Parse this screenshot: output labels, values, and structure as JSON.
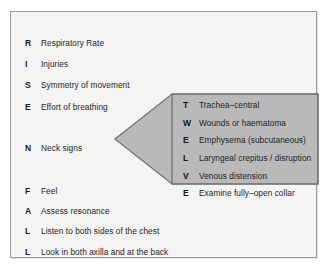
{
  "figure": {
    "panel_background": "#f4f4f2",
    "panel_border": "#9a9a9a",
    "callout_fill": "#b9b9b9",
    "callout_border": "#6f6f6f"
  },
  "main_list": {
    "name": "rise-n-fall-mnemonic",
    "items": [
      {
        "letter": "R",
        "text": "Respiratory Rate",
        "top": 24
      },
      {
        "letter": "I",
        "text": "Injuries",
        "top": 45
      },
      {
        "letter": "S",
        "text": "Symmetry of movement",
        "top": 66
      },
      {
        "letter": "E",
        "text": "Effort of breathing",
        "top": 88
      },
      {
        "letter": "N",
        "text": "Neck signs",
        "top": 129
      },
      {
        "letter": "F",
        "text": "Feel",
        "top": 172
      },
      {
        "letter": "A",
        "text": "Assess resonance",
        "top": 192
      },
      {
        "letter": "L",
        "text": "Listen to both sides of the chest",
        "top": 212
      },
      {
        "letter": "L",
        "text": "Look in both axilla and at the back",
        "top": 233
      }
    ]
  },
  "callout": {
    "name": "neck-signs-twelve-mnemonic",
    "items": [
      {
        "letter": "T",
        "text": "Trachea–central",
        "top": 15
      },
      {
        "letter": "W",
        "text": "Wounds or haematoma",
        "top": 33
      },
      {
        "letter": "E",
        "text": "Emphysema (subcutaneous)",
        "top": 50
      },
      {
        "letter": "L",
        "text": "Laryngeal crepitus / disruption",
        "top": 68
      },
      {
        "letter": "V",
        "text": "Venous distension",
        "top": 86
      },
      {
        "letter": "E",
        "text": "Examine fully–open collar",
        "top": 103
      }
    ]
  }
}
